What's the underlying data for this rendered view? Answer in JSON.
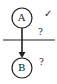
{
  "nodes": [
    {
      "id": "A",
      "label": "A",
      "status": "✓"
    },
    {
      "id": "B",
      "label": "B",
      "status": "?"
    }
  ],
  "edge": {
    "from": "A",
    "to": "B",
    "label": "?"
  },
  "colors": {
    "stroke": "#222222",
    "background": "#ffffff"
  }
}
